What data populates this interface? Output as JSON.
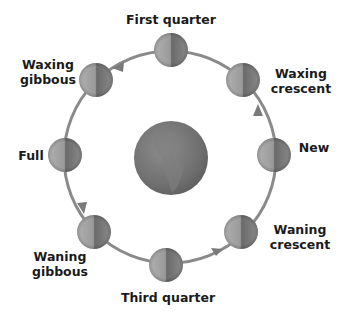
{
  "diagram": {
    "center": {
      "name": "Earth",
      "x": 171,
      "y": 158,
      "r": 37
    },
    "orbit": {
      "cx": 170,
      "cy": 157,
      "r": 106,
      "color": "#8a8a8a"
    },
    "phases": [
      {
        "id": "first-quarter",
        "label": "First quarter",
        "x": 171,
        "y": 50
      },
      {
        "id": "waxing-crescent",
        "label": "Waxing\ncrescent",
        "x": 243,
        "y": 80
      },
      {
        "id": "new",
        "label": "New",
        "x": 274,
        "y": 155
      },
      {
        "id": "waning-crescent",
        "label": "Waning\ncrescent",
        "x": 241,
        "y": 232
      },
      {
        "id": "third-quarter",
        "label": "Third quarter",
        "x": 166,
        "y": 265
      },
      {
        "id": "waning-gibbous",
        "label": "Waning\ngibbous",
        "x": 94,
        "y": 232
      },
      {
        "id": "full",
        "label": "Full",
        "x": 65,
        "y": 155
      },
      {
        "id": "waxing-gibbous",
        "label": "Waxing\ngibbous",
        "x": 96,
        "y": 80
      }
    ],
    "labels": {
      "first_quarter": "First quarter",
      "waxing_crescent_1": "Waxing",
      "waxing_crescent_2": "crescent",
      "new": "New",
      "waning_crescent_1": "Waning",
      "waning_crescent_2": "crescent",
      "third_quarter": "Third quarter",
      "waning_gibbous_1": "Waning",
      "waning_gibbous_2": "gibbous",
      "full": "Full",
      "waxing_gibbous_1": "Waxing",
      "waxing_gibbous_2": "gibbous"
    },
    "direction": "counterclockwise"
  }
}
